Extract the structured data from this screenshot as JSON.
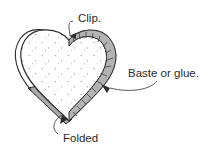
{
  "figure": {
    "background_color": "#ffffff",
    "ink_color": "#2b2b2b",
    "fill_color": "#ffffff",
    "seam_band_color": "#b3b3b3",
    "wedge_color": "#a8a8a8",
    "stipple_color": "#8a8a8a",
    "labels": {
      "clip": "Clip.",
      "baste": "Baste or glue.",
      "folded": "Folded"
    }
  }
}
